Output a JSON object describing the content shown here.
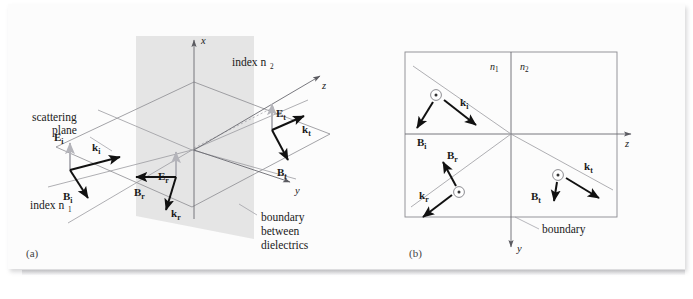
{
  "figure": {
    "panels": [
      {
        "key": "a",
        "label": "(a)",
        "caption": "three-dimensional perspective view"
      },
      {
        "key": "b",
        "label": "(b)",
        "caption": "projection onto the scattering plane"
      }
    ]
  },
  "panel_a": {
    "label": "(a)",
    "axes": [
      {
        "name": "x",
        "letter": "x",
        "direction": "up"
      },
      {
        "name": "y",
        "letter": "y",
        "direction": "right-down"
      },
      {
        "name": "z",
        "letter": "z",
        "direction": "up-right"
      }
    ],
    "annotations": {
      "index_n1": "index n",
      "index_n1_sub": "1",
      "index_n2": "index n",
      "index_n2_sub": "2",
      "scattering_plane_line1": "scattering",
      "scattering_plane_line2": "plane",
      "boundary_line1": "boundary",
      "boundary_line2": "between",
      "boundary_line3": "dielectrics"
    },
    "vectors": [
      {
        "name": "E_i",
        "symbol": "E",
        "subscript": "i",
        "color": "#b4b4ba",
        "role": "incident-electric-field",
        "direction": "up"
      },
      {
        "name": "k_i",
        "symbol": "k",
        "subscript": "i",
        "color": "#111111",
        "role": "incident-wave-vector",
        "direction": "right-up"
      },
      {
        "name": "B_i",
        "symbol": "B",
        "subscript": "i",
        "color": "#111111",
        "role": "incident-magnetic-field",
        "direction": "down-right"
      },
      {
        "name": "E_r",
        "symbol": "E",
        "subscript": "r",
        "color": "#b4b4ba",
        "role": "reflected-electric-field",
        "direction": "up"
      },
      {
        "name": "B_r",
        "symbol": "B",
        "subscript": "r",
        "color": "#111111",
        "role": "reflected-magnetic-field",
        "direction": "left"
      },
      {
        "name": "k_r",
        "symbol": "k",
        "subscript": "r",
        "color": "#111111",
        "role": "reflected-wave-vector",
        "direction": "down-left"
      },
      {
        "name": "E_t",
        "symbol": "E",
        "subscript": "t",
        "color": "#b4b4ba",
        "role": "transmitted-electric-field",
        "direction": "up"
      },
      {
        "name": "k_t",
        "symbol": "k",
        "subscript": "t",
        "color": "#111111",
        "role": "transmitted-wave-vector",
        "direction": "right-up"
      },
      {
        "name": "B_t",
        "symbol": "B",
        "subscript": "t",
        "color": "#111111",
        "role": "transmitted-magnetic-field",
        "direction": "down-right"
      }
    ]
  },
  "panel_b": {
    "label": "(b)",
    "axes": [
      {
        "name": "y",
        "letter": "y",
        "direction": "down"
      },
      {
        "name": "z",
        "letter": "z",
        "direction": "right"
      }
    ],
    "annotations": {
      "n1": "n",
      "n1_sub": "1",
      "n2": "n",
      "n2_sub": "2",
      "boundary": "boundary"
    },
    "vectors": [
      {
        "name": "k_i",
        "symbol": "k",
        "subscript": "i",
        "color": "#111111",
        "role": "incident-wave-vector",
        "direction": "down-right"
      },
      {
        "name": "B_i",
        "symbol": "B",
        "subscript": "i",
        "color": "#111111",
        "role": "incident-magnetic-field",
        "direction": "down-left"
      },
      {
        "name": "B_r",
        "symbol": "B",
        "subscript": "r",
        "color": "#111111",
        "role": "reflected-magnetic-field",
        "direction": "up-left"
      },
      {
        "name": "k_r",
        "symbol": "k",
        "subscript": "r",
        "color": "#111111",
        "role": "reflected-wave-vector",
        "direction": "down-left"
      },
      {
        "name": "k_t",
        "symbol": "k",
        "subscript": "t",
        "color": "#111111",
        "role": "transmitted-wave-vector",
        "direction": "down-right"
      },
      {
        "name": "B_t",
        "symbol": "B",
        "subscript": "t",
        "color": "#111111",
        "role": "transmitted-magnetic-field",
        "direction": "down"
      }
    ],
    "field_dots": [
      {
        "name": "E_i-out-of-page",
        "glyph": "circled-dot",
        "role": "incident-electric-field-out-of-page"
      },
      {
        "name": "E_r-out-of-page",
        "glyph": "circled-dot",
        "role": "reflected-electric-field-out-of-page"
      },
      {
        "name": "E_t-out-of-page",
        "glyph": "circled-dot",
        "role": "transmitted-electric-field-out-of-page"
      }
    ]
  }
}
